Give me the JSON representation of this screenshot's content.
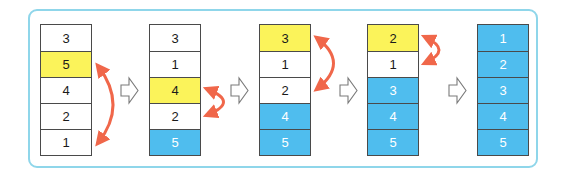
{
  "diagram": {
    "title": "",
    "colors": {
      "frame_border": "#8fd6ea",
      "compare_cell": "#fbf35a",
      "sorted_cell": "#4fbdee",
      "unsorted_cell": "#ffffff",
      "swap_arrow": "#f0674a",
      "step_arrow": "#7a7a7a"
    },
    "legend": {
      "compare": "yellow = element being moved",
      "sorted": "blue = sorted position",
      "unsorted": "white = unsorted"
    },
    "stacks": [
      {
        "name": "step-1",
        "cells": [
          {
            "value": "3",
            "state": "unsorted"
          },
          {
            "value": "5",
            "state": "compare"
          },
          {
            "value": "4",
            "state": "unsorted"
          },
          {
            "value": "2",
            "state": "unsorted"
          },
          {
            "value": "1",
            "state": "unsorted"
          }
        ],
        "swap": {
          "from_index": 1,
          "to_index": 4
        }
      },
      {
        "name": "step-2",
        "cells": [
          {
            "value": "3",
            "state": "unsorted"
          },
          {
            "value": "1",
            "state": "unsorted"
          },
          {
            "value": "4",
            "state": "compare"
          },
          {
            "value": "2",
            "state": "unsorted"
          },
          {
            "value": "5",
            "state": "sorted"
          }
        ],
        "swap": {
          "from_index": 2,
          "to_index": 3
        }
      },
      {
        "name": "step-3",
        "cells": [
          {
            "value": "3",
            "state": "compare"
          },
          {
            "value": "1",
            "state": "unsorted"
          },
          {
            "value": "2",
            "state": "unsorted"
          },
          {
            "value": "4",
            "state": "sorted"
          },
          {
            "value": "5",
            "state": "sorted"
          }
        ],
        "swap": {
          "from_index": 0,
          "to_index": 2
        }
      },
      {
        "name": "step-4",
        "cells": [
          {
            "value": "2",
            "state": "compare"
          },
          {
            "value": "1",
            "state": "unsorted"
          },
          {
            "value": "3",
            "state": "sorted"
          },
          {
            "value": "4",
            "state": "sorted"
          },
          {
            "value": "5",
            "state": "sorted"
          }
        ],
        "swap": {
          "from_index": 0,
          "to_index": 1
        }
      },
      {
        "name": "step-5",
        "cells": [
          {
            "value": "1",
            "state": "sorted"
          },
          {
            "value": "2",
            "state": "sorted"
          },
          {
            "value": "3",
            "state": "sorted"
          },
          {
            "value": "4",
            "state": "sorted"
          },
          {
            "value": "5",
            "state": "sorted"
          }
        ],
        "swap": null
      }
    ],
    "step_arrows": [
      {
        "name": "step-arrow-1",
        "icon": "hollow-right-arrow"
      },
      {
        "name": "step-arrow-2",
        "icon": "hollow-right-arrow"
      },
      {
        "name": "step-arrow-3",
        "icon": "hollow-right-arrow"
      },
      {
        "name": "step-arrow-4",
        "icon": "hollow-right-arrow"
      }
    ]
  }
}
